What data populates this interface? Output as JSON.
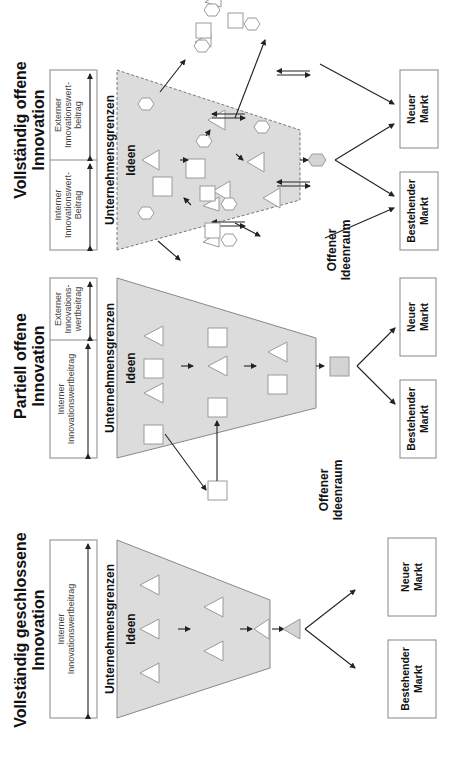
{
  "panels": [
    {
      "id": "closed",
      "title_line1": "Vollständig geschlossene",
      "title_line2": "Innovation",
      "internal_contribution_line1": "Interner",
      "internal_contribution_line2": "Innovationswertbeitrag",
      "boundary_label": "Unternehmensgrenzen",
      "ideas_label": "Ideen",
      "market_existing_line1": "Bestehender",
      "market_existing_line2": "Markt",
      "market_new_line1": "Neuer",
      "market_new_line2": "Markt"
    },
    {
      "id": "partial",
      "title_line1": "Partiell offene",
      "title_line2": "Innovation",
      "internal_contribution_line1": "Interner",
      "internal_contribution_line2": "Innovationswertbeitrag",
      "external_contribution_line1": "Externer",
      "external_contribution_line2": "Innovations-",
      "external_contribution_line3": "wertbeitrag",
      "boundary_label": "Unternehmensgrenzen",
      "ideas_label": "Ideen",
      "open_space_line1": "Offener",
      "open_space_line2": "Ideenraum",
      "market_existing_line1": "Bestehender",
      "market_existing_line2": "Markt",
      "market_new_line1": "Neuer",
      "market_new_line2": "Markt"
    },
    {
      "id": "open",
      "title_line1": "Vollständig offene",
      "title_line2": "Innovation",
      "internal_contribution_line1": "Interner",
      "internal_contribution_line2": "Innovationswert-",
      "internal_contribution_line3": "Beitrag",
      "external_contribution_line1": "Externer",
      "external_contribution_line2": "Innovationswert-",
      "external_contribution_line3": "beitrag",
      "boundary_label": "Unternehmensgrenzen",
      "ideas_label": "Ideen",
      "open_space_line1": "Offener",
      "open_space_line2": "Ideenraum",
      "market_existing_line1": "Bestehender",
      "market_existing_line2": "Markt",
      "market_new_line1": "Neuer",
      "market_new_line2": "Markt"
    }
  ],
  "colors": {
    "funnel_fill": "#dcdcdc",
    "shape_stroke": "#9a9a9a",
    "arrow": "#222222",
    "text": "#111111"
  },
  "orientation": "rotated-90-ccw"
}
